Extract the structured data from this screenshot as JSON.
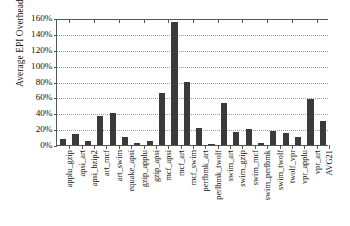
{
  "chart_data": {
    "type": "bar",
    "title": "",
    "xlabel": "",
    "ylabel": "Average EPI Overhead",
    "ylim": [
      0,
      160
    ],
    "ytick_labels": [
      "0%",
      "20%",
      "40%",
      "60%",
      "80%",
      "100%",
      "120%",
      "140%",
      "160%"
    ],
    "ytick_values": [
      0,
      20,
      40,
      60,
      80,
      100,
      120,
      140,
      160
    ],
    "grid": true,
    "legend": "none",
    "units": "percent",
    "categories": [
      "applu_gzip",
      "apsi_art",
      "apsi_bzip2",
      "art_mcf",
      "art_swim",
      "equake_apsi",
      "gzip_applu",
      "gzip_apsi",
      "mcf_apsi",
      "mcf_art",
      "mcf_swim",
      "perfbmk_art",
      "perlbmk_twolf",
      "swim_art",
      "swim_gzip",
      "swim_mcf",
      "swim_perlbmk",
      "swim_twolf",
      "twolf_vpr",
      "vpr_applu",
      "vpr_art",
      "AVG21"
    ],
    "values": [
      7,
      14,
      5,
      37,
      40,
      10,
      3,
      5,
      65,
      155,
      80,
      22,
      1,
      53,
      17,
      20,
      2,
      18,
      15,
      10,
      58,
      30
    ]
  }
}
